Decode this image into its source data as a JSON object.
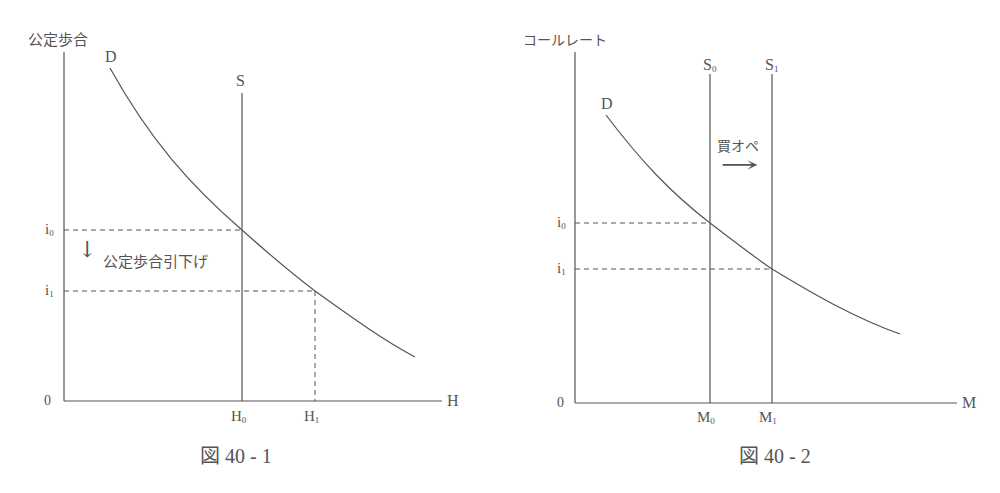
{
  "figure1": {
    "caption": "図 40 - 1",
    "y_axis_label": "公定歩合",
    "x_axis_label": "H",
    "origin": "0",
    "demand_label": "D",
    "supply_label": "S",
    "rate_labels": {
      "i0_base": "i",
      "i0_sub": "0",
      "i1_base": "i",
      "i1_sub": "1"
    },
    "quantity_labels": {
      "h0_base": "H",
      "h0_sub": "0",
      "h1_base": "H",
      "h1_sub": "1"
    },
    "annotation": "公定歩合引下げ",
    "annotation_arrow": "↓"
  },
  "figure2": {
    "caption": "図 40 - 2",
    "y_axis_label": "コールレート",
    "x_axis_label": "M",
    "origin": "0",
    "demand_label": "D",
    "supply_labels": {
      "s0_base": "S",
      "s0_sub": "0",
      "s1_base": "S",
      "s1_sub": "1"
    },
    "rate_labels": {
      "i0_base": "i",
      "i0_sub": "0",
      "i1_base": "i",
      "i1_sub": "1"
    },
    "quantity_labels": {
      "m0_base": "M",
      "m0_sub": "0",
      "m1_base": "M",
      "m1_sub": "1"
    },
    "annotation": "買オペ",
    "annotation_arrow": "→"
  },
  "colors": {
    "line": "#555555",
    "text": "#555555",
    "background": "#ffffff"
  }
}
